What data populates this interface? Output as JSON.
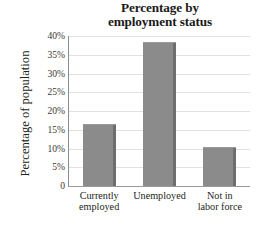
{
  "chart_data": {
    "type": "bar",
    "title": "Percentage by employment status",
    "title_lines": [
      "Percentage by",
      "employment status"
    ],
    "xlabel": "",
    "ylabel": "Percentage of population",
    "categories": [
      "Currently employed",
      "Unemployed",
      "Not in labor force"
    ],
    "category_lines": [
      [
        "Currently",
        "employed"
      ],
      [
        "Unemployed"
      ],
      [
        "Not in",
        "labor force"
      ]
    ],
    "values": [
      16.5,
      38.5,
      10.5
    ],
    "ylim": [
      0,
      40
    ],
    "ytick_values": [
      40,
      35,
      30,
      25,
      20,
      15,
      10,
      5,
      0
    ],
    "ytick_labels": [
      "40%",
      "35%",
      "30%",
      "25%",
      "20%",
      "15%",
      "10%",
      "5%",
      "0"
    ],
    "grid": true,
    "legend": "none",
    "bar_color": "#8b8b8b",
    "bar_edge_color": "#6e6e6e",
    "grid_color": "#e3e1df",
    "axis_color": "#8c8c8c",
    "text_color": "#231f20"
  }
}
